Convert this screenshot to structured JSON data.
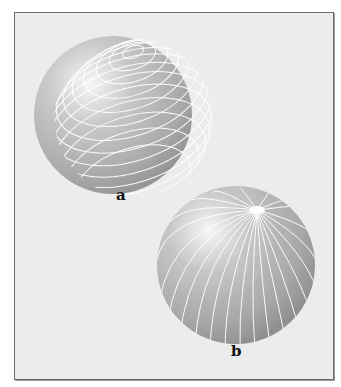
{
  "figure": {
    "panels": [
      {
        "id": "a",
        "label": "a",
        "description": "Sphere with parallel circles (latitude lines) around a tilted axis"
      },
      {
        "id": "b",
        "label": "b",
        "description": "Sphere with meridians (longitude lines) converging at a pole"
      }
    ],
    "colors": {
      "background": "#ececec",
      "sphere_light": "#f4f4f4",
      "sphere_mid": "#b9b9b9",
      "sphere_dark": "#8e8e8e",
      "lines": "#ffffff",
      "border": "#6a6a6a"
    }
  }
}
